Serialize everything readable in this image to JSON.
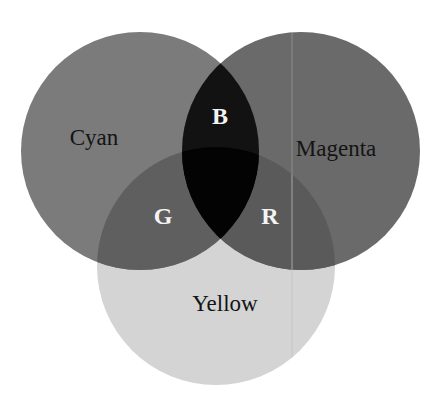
{
  "diagram": {
    "type": "venn",
    "title": "",
    "sets": [
      {
        "id": "cyan",
        "label": "Cyan",
        "cx": 140,
        "cy": 151,
        "r": 119,
        "fill": "#7b7b7b",
        "label_x": 94,
        "label_y": 145
      },
      {
        "id": "magenta",
        "label": "Magenta",
        "cx": 301,
        "cy": 151,
        "r": 119,
        "fill": "#6a6a6a",
        "label_x": 336,
        "label_y": 156
      },
      {
        "id": "yellow",
        "label": "Yellow",
        "cx": 216,
        "cy": 266,
        "r": 119,
        "fill": "#d4d4d4",
        "label_x": 225,
        "label_y": 311
      }
    ],
    "intersections": [
      {
        "id": "cyan-magenta",
        "sets": [
          "cyan",
          "magenta"
        ],
        "label": "B",
        "fill": "#121212",
        "label_x": 220,
        "label_y": 124
      },
      {
        "id": "cyan-yellow",
        "sets": [
          "cyan",
          "yellow"
        ],
        "label": "G",
        "fill": "#5f5f5f",
        "label_x": 163,
        "label_y": 224
      },
      {
        "id": "magenta-yellow",
        "sets": [
          "magenta",
          "yellow"
        ],
        "label": "R",
        "fill": "#5a5a5a",
        "label_x": 270,
        "label_y": 224
      },
      {
        "id": "cyan-magenta-yellow",
        "sets": [
          "cyan",
          "magenta",
          "yellow"
        ],
        "label": "",
        "fill": "#030303"
      }
    ],
    "artifact_line": {
      "x": 292,
      "y1": 33,
      "y2": 384,
      "color": "#a8a8a8"
    }
  }
}
